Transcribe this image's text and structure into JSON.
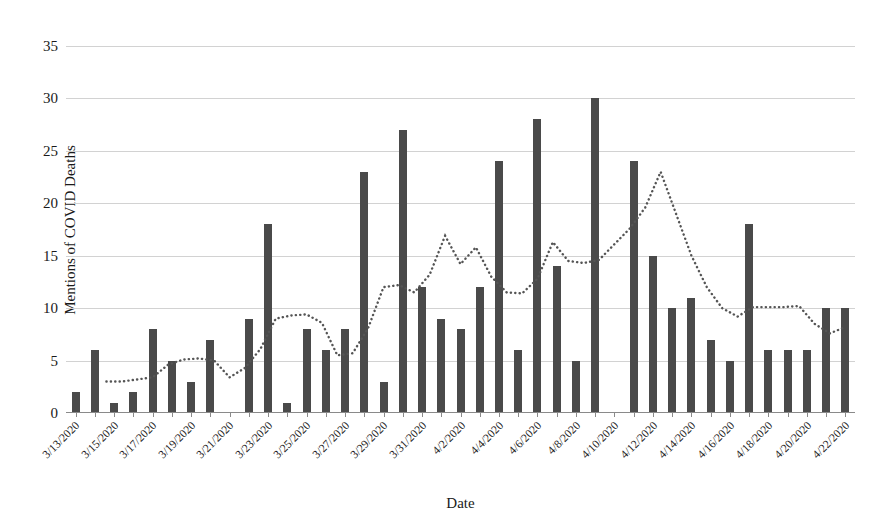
{
  "chart_data": {
    "type": "bar",
    "title": "",
    "xlabel": "Date",
    "ylabel": "Mentions of COVID Deaths",
    "ylim": [
      0,
      35
    ],
    "yticks": [
      0,
      5,
      10,
      15,
      20,
      25,
      30,
      35
    ],
    "grid": true,
    "legend": "none",
    "bar_color": "#4a4a4a",
    "trend_color": "#555555",
    "trend_style": "dotted",
    "trend_name": "moving average trend line",
    "categories": [
      "3/13/2020",
      "3/14/2020",
      "3/15/2020",
      "3/16/2020",
      "3/17/2020",
      "3/18/2020",
      "3/19/2020",
      "3/20/2020",
      "3/21/2020",
      "3/22/2020",
      "3/23/2020",
      "3/24/2020",
      "3/25/2020",
      "3/26/2020",
      "3/27/2020",
      "3/28/2020",
      "3/29/2020",
      "3/30/2020",
      "3/31/2020",
      "4/1/2020",
      "4/2/2020",
      "4/3/2020",
      "4/4/2020",
      "4/5/2020",
      "4/6/2020",
      "4/7/2020",
      "4/8/2020",
      "4/9/2020",
      "4/10/2020",
      "4/11/2020",
      "4/12/2020",
      "4/13/2020",
      "4/14/2020",
      "4/15/2020",
      "4/16/2020",
      "4/17/2020",
      "4/18/2020",
      "4/19/2020",
      "4/20/2020",
      "4/21/2020",
      "4/22/2020"
    ],
    "tick_labels": [
      "3/13/2020",
      "",
      "3/15/2020",
      "",
      "3/17/2020",
      "",
      "3/19/2020",
      "",
      "3/21/2020",
      "",
      "3/23/2020",
      "",
      "3/25/2020",
      "",
      "3/27/2020",
      "",
      "3/29/2020",
      "",
      "3/31/2020",
      "",
      "4/2/2020",
      "",
      "4/4/2020",
      "",
      "4/6/2020",
      "",
      "4/8/2020",
      "",
      "4/10/2020",
      "",
      "4/12/2020",
      "",
      "4/14/2020",
      "",
      "4/16/2020",
      "",
      "4/18/2020",
      "",
      "4/20/2020",
      "",
      "4/22/2020"
    ],
    "values": [
      2,
      6,
      1,
      2,
      8,
      5,
      3,
      7,
      0,
      9,
      18,
      1,
      8,
      6,
      8,
      23,
      3,
      27,
      12,
      9,
      8,
      12,
      24,
      6,
      28,
      14,
      5,
      30,
      0,
      24,
      15,
      10,
      11,
      7,
      5,
      18,
      6,
      6,
      6,
      10,
      10
    ],
    "trend": [
      null,
      null,
      3.0,
      3.0,
      3.2,
      3.4,
      4.6,
      5.1,
      5.2,
      5.0,
      3.4,
      4.3,
      6.1,
      9.0,
      9.3,
      9.4,
      8.6,
      5.5,
      5.7,
      8.1,
      12.0,
      12.2,
      11.5,
      13.2,
      16.9,
      14.2,
      15.8,
      13.0,
      11.5,
      11.4,
      12.8,
      16.3,
      14.5,
      14.3,
      14.6,
      16.1,
      17.6,
      19.6,
      23.0,
      19.0,
      15.0,
      12.0,
      10.0,
      9.2,
      10.1,
      10.1,
      10.1,
      10.2,
      8.5,
      7.6,
      8.2
    ]
  }
}
